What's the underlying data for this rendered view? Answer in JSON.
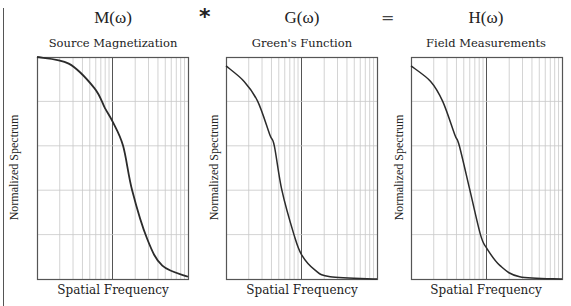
{
  "operators": {
    "convolution": "*",
    "equals": "="
  },
  "panels": [
    {
      "symbol": "M(ω)",
      "title": "Source Magnetization",
      "xlabel": "Spatial Frequency",
      "ylabel": "Normalized Spectrum"
    },
    {
      "symbol": "G(ω)",
      "title": "Green's Function",
      "xlabel": "Spatial Frequency",
      "ylabel": "Normalized Spectrum"
    },
    {
      "symbol": "H(ω)",
      "title": "Field Measurements",
      "xlabel": "Spatial Frequency",
      "ylabel": "Normalized Spectrum"
    }
  ],
  "colors": {
    "curve": "#2b2b2b",
    "grid": "#c8c8c8",
    "decade_line": "#555555",
    "frame": "#555555"
  },
  "chart_data": [
    {
      "type": "line",
      "title": "Source Magnetization",
      "symbol": "M(ω)",
      "xlabel": "Spatial Frequency",
      "ylabel": "Normalized Spectrum",
      "xscale": "log",
      "x_decades": 2,
      "grid": true,
      "ylim": [
        0,
        1
      ],
      "x_fraction": [
        0.0,
        0.21,
        0.38,
        0.45,
        0.5,
        0.57,
        0.63,
        0.73,
        0.83,
        1.0
      ],
      "values": [
        1.0,
        0.97,
        0.86,
        0.77,
        0.71,
        0.6,
        0.4,
        0.18,
        0.06,
        0.01
      ]
    },
    {
      "type": "line",
      "title": "Green's Function",
      "symbol": "G(ω)",
      "xlabel": "Spatial Frequency",
      "ylabel": "Normalized Spectrum",
      "xscale": "log",
      "x_decades": 2,
      "grid": true,
      "ylim": [
        0,
        1
      ],
      "x_fraction": [
        0.0,
        0.12,
        0.21,
        0.29,
        0.32,
        0.37,
        0.45,
        0.5,
        0.59,
        0.69,
        1.0
      ],
      "values": [
        0.96,
        0.89,
        0.8,
        0.65,
        0.6,
        0.4,
        0.2,
        0.11,
        0.04,
        0.01,
        0.0
      ]
    },
    {
      "type": "line",
      "title": "Field Measurements",
      "symbol": "H(ω)",
      "xlabel": "Spatial Frequency",
      "ylabel": "Normalized Spectrum",
      "xscale": "log",
      "x_decades": 2,
      "grid": true,
      "ylim": [
        0,
        1
      ],
      "x_fraction": [
        0.0,
        0.13,
        0.21,
        0.29,
        0.32,
        0.39,
        0.46,
        0.5,
        0.59,
        0.72,
        1.0
      ],
      "values": [
        0.96,
        0.89,
        0.8,
        0.65,
        0.6,
        0.4,
        0.2,
        0.14,
        0.06,
        0.01,
        0.0
      ]
    }
  ]
}
